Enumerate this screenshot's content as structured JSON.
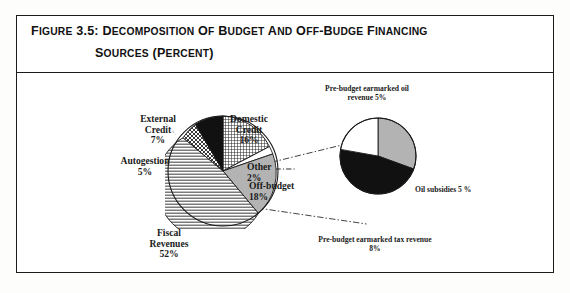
{
  "figure": {
    "title_line_1_prefix": "F",
    "title_line_1": "FIGURE 3.5: DECOMPOSITION OF BUDGET AND OFF-BUDGE FINANCING",
    "title_line_2": "SOURCES (PERCENT)"
  },
  "labels": {
    "external_credit": "External\nCredit\n7%",
    "domestic_credit": "Domestic\nCredit\n16%",
    "autogestion": "Autogestion\n5%",
    "other": "Other\n2%",
    "off_budget": "Off-budget\n18%",
    "fiscal_revenues": "Fiscal\nRevenues\n52%",
    "prebudget_oil": "Pre-budget earmarked oil\nrevenue 5%",
    "oil_subsidies": "Oil  subsidies 5 %",
    "prebudget_tax": "Pre-budget earmarked tax revenue\n8%"
  },
  "colors": {
    "ink": "#1a1a1a",
    "frame": "#1b1b1b",
    "black_slice": "#111111",
    "gray_slice": "#b3b3b3",
    "white_slice": "#ffffff",
    "hatch_light": "#d8d8d8"
  },
  "chart_data": [
    {
      "type": "pie",
      "title": "Decomposition of Budget and Off-Budge Financing Sources (percent)",
      "name": "budget-financing-sources",
      "unit": "percent",
      "legend": "none",
      "labels_position": "outside-with-leaders",
      "categories": [
        "Domestic Credit",
        "Other",
        "Off-budget",
        "Fiscal Revenues",
        "Autogestion",
        "External Credit"
      ],
      "values": [
        16,
        2,
        18,
        52,
        5,
        7
      ],
      "value_labels": [
        "16%",
        "2%",
        "18%",
        "52%",
        "5%",
        "7%"
      ],
      "fills": [
        "crosshatch",
        "white",
        "gray",
        "horizontal-lines",
        "checker",
        "black"
      ],
      "start_angle_deg": 0,
      "direction": "clockwise"
    },
    {
      "type": "pie",
      "title": "Off-budget decomposition",
      "name": "off-budget-decomposition",
      "unit": "percent",
      "legend": "none",
      "labels_position": "outside",
      "categories": [
        "Oil subsidies",
        "Pre-budget earmarked tax revenue",
        "Pre-budget earmarked oil revenue"
      ],
      "values": [
        5,
        8,
        5
      ],
      "value_labels": [
        "5 %",
        "8%",
        "5%"
      ],
      "fills": [
        "gray",
        "black",
        "white"
      ],
      "start_angle_deg": 0,
      "direction": "clockwise"
    }
  ]
}
